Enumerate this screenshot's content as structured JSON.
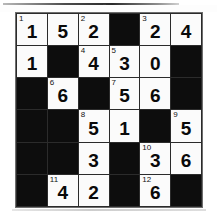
{
  "puzzle": {
    "title": "Number Crossword Grid",
    "rows": 6,
    "columns": 6,
    "colors": {
      "block": "#0d0d0d",
      "open": "#fbfbfb",
      "grid_line": "#2b2b2b",
      "digit": "#0a0a0a",
      "clue_number": "#121212"
    },
    "cells": [
      [
        {
          "type": "open",
          "clue": "1",
          "value": "1"
        },
        {
          "type": "open",
          "clue": "",
          "value": "5"
        },
        {
          "type": "open",
          "clue": "2",
          "value": "2"
        },
        {
          "type": "block",
          "clue": "",
          "value": ""
        },
        {
          "type": "open",
          "clue": "3",
          "value": "2"
        },
        {
          "type": "open",
          "clue": "",
          "value": "4"
        }
      ],
      [
        {
          "type": "open",
          "clue": "",
          "value": "1"
        },
        {
          "type": "block",
          "clue": "",
          "value": ""
        },
        {
          "type": "open",
          "clue": "4",
          "value": "4"
        },
        {
          "type": "open",
          "clue": "5",
          "value": "3"
        },
        {
          "type": "open",
          "clue": "",
          "value": "0"
        },
        {
          "type": "block",
          "clue": "",
          "value": ""
        }
      ],
      [
        {
          "type": "block",
          "clue": "",
          "value": ""
        },
        {
          "type": "open",
          "clue": "6",
          "value": "6"
        },
        {
          "type": "block",
          "clue": "",
          "value": ""
        },
        {
          "type": "open",
          "clue": "7",
          "value": "5"
        },
        {
          "type": "open",
          "clue": "",
          "value": "6"
        },
        {
          "type": "block",
          "clue": "",
          "value": ""
        }
      ],
      [
        {
          "type": "block",
          "clue": "",
          "value": ""
        },
        {
          "type": "block",
          "clue": "",
          "value": ""
        },
        {
          "type": "open",
          "clue": "8",
          "value": "5"
        },
        {
          "type": "open",
          "clue": "",
          "value": "1"
        },
        {
          "type": "block",
          "clue": "",
          "value": ""
        },
        {
          "type": "open",
          "clue": "9",
          "value": "5"
        }
      ],
      [
        {
          "type": "block",
          "clue": "",
          "value": ""
        },
        {
          "type": "block",
          "clue": "",
          "value": ""
        },
        {
          "type": "open",
          "clue": "",
          "value": "3"
        },
        {
          "type": "block",
          "clue": "",
          "value": ""
        },
        {
          "type": "open",
          "clue": "10",
          "value": "3"
        },
        {
          "type": "open",
          "clue": "",
          "value": "6"
        }
      ],
      [
        {
          "type": "block",
          "clue": "",
          "value": ""
        },
        {
          "type": "open",
          "clue": "11",
          "value": "4"
        },
        {
          "type": "open",
          "clue": "",
          "value": "2"
        },
        {
          "type": "block",
          "clue": "",
          "value": ""
        },
        {
          "type": "open",
          "clue": "12",
          "value": "6"
        },
        {
          "type": "block",
          "clue": "",
          "value": ""
        }
      ]
    ]
  }
}
